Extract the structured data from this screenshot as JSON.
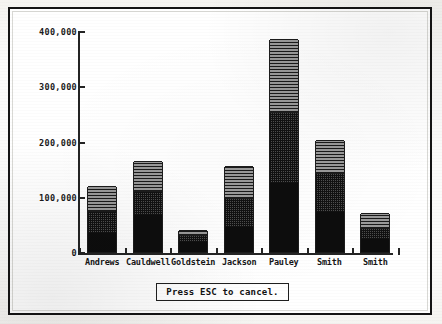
{
  "window": {
    "title": "Stacked Bar Chart",
    "frame_color": "#141414",
    "background_color": "#ffffff"
  },
  "prompt": {
    "message": "Press ESC to cancel.",
    "key": "ESC"
  },
  "chart_data": {
    "type": "bar",
    "title": "",
    "subtitle": "",
    "xlabel": "",
    "ylabel": "",
    "stacked": true,
    "grid": false,
    "legend_position": "none",
    "ylim": [
      0,
      400000
    ],
    "ytick_values": [
      400000,
      300000,
      200000,
      100000,
      0
    ],
    "ytick_labels": [
      "400,000",
      "300,000",
      "200,000",
      "100,000",
      "0"
    ],
    "categories": [
      "Andrews",
      "Cauldwell",
      "Goldstein",
      "Jackson",
      "Pauley",
      "Smith",
      "Smith"
    ],
    "series": [
      {
        "name": "series-1",
        "pattern": "solid-black",
        "color": "#0d0d0d",
        "values": [
          35000,
          67000,
          18000,
          45000,
          125000,
          73000,
          23000
        ]
      },
      {
        "name": "series-2",
        "pattern": "cross-hatch",
        "color": "#4e4e4e",
        "values": [
          40000,
          43000,
          13000,
          52000,
          128000,
          70000,
          20000
        ]
      },
      {
        "name": "series-3",
        "pattern": "horizontal-lines",
        "color": "#6d6d6d",
        "values": [
          45000,
          55000,
          9000,
          58000,
          132000,
          60000,
          27000
        ]
      }
    ],
    "totals": [
      120000,
      165000,
      40000,
      155000,
      385000,
      203000,
      70000
    ]
  }
}
